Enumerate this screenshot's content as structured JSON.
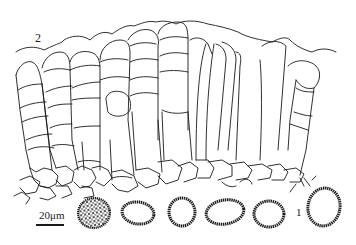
{
  "figure": {
    "type": "scientific line drawing",
    "labels": {
      "part_2": "2",
      "part_1": "1",
      "scale_bar": "20μm"
    },
    "spores": [
      {
        "id": "spore-1",
        "style": "filled-reticulate",
        "cx": 94,
        "cy": 213,
        "rx": 17,
        "ry": 16
      },
      {
        "id": "spore-2",
        "style": "ring-verrucose",
        "cx": 138,
        "cy": 213,
        "rx": 17,
        "ry": 12
      },
      {
        "id": "spore-3",
        "style": "ring-verrucose",
        "cx": 182,
        "cy": 212,
        "rx": 14,
        "ry": 14
      },
      {
        "id": "spore-4",
        "style": "ring-verrucose",
        "cx": 225,
        "cy": 212,
        "rx": 20,
        "ry": 13
      },
      {
        "id": "spore-5",
        "style": "ring-verrucose",
        "cx": 269,
        "cy": 214,
        "rx": 15,
        "ry": 14
      },
      {
        "id": "spore-6",
        "style": "ring-verrucose",
        "cx": 324,
        "cy": 207,
        "rx": 17,
        "ry": 20
      }
    ],
    "colors": {
      "ink": "#1a1a1a",
      "background": "#ffffff"
    }
  }
}
